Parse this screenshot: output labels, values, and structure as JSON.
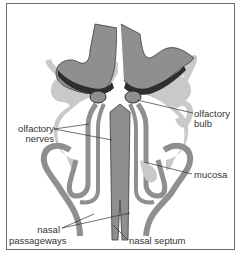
{
  "figure": {
    "colors": {
      "dark_tissue": "#2e2e2e",
      "mid_tissue": "#8f8f8f",
      "light_tissue": "#c9c9c9",
      "outline": "#3a3a3a",
      "background": "#ffffff",
      "frame": "#6a6a6a"
    },
    "labels": {
      "olfactory_bulb_line1": "olfactory",
      "olfactory_bulb_line2": "bulb",
      "olfactory_nerves_line1": "olfactory",
      "olfactory_nerves_line2": "nerves",
      "mucosa": "mucosa",
      "nasal_passageways_line1": "nasal",
      "nasal_passageways_line2": "passageways",
      "nasal_septum": "nasal septum"
    }
  }
}
